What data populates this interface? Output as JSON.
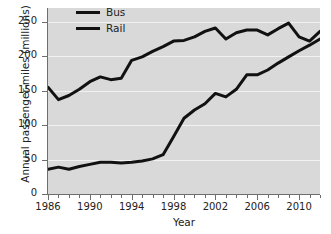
{
  "chart_data": {
    "type": "line",
    "title": "",
    "xlabel": "Year",
    "ylabel": "Annual passenger-miles (millions)",
    "xlim": [
      1986,
      2012
    ],
    "ylim": [
      0,
      270
    ],
    "grid": true,
    "legend_position": "top-left-inside",
    "y_ticks": [
      0,
      50,
      100,
      150,
      200,
      250
    ],
    "y_tick_labels": [
      "0",
      "50",
      "100",
      "150",
      "200",
      "250"
    ],
    "x_ticks": [
      1986,
      1990,
      1994,
      1998,
      2002,
      2006,
      2010
    ],
    "x_tick_labels": [
      "1986",
      "1990",
      "1994",
      "1998",
      "2002",
      "2006",
      "2010"
    ],
    "x_minor_ticks": [
      1986,
      1987,
      1988,
      1989,
      1990,
      1991,
      1992,
      1993,
      1994,
      1995,
      1996,
      1997,
      1998,
      1999,
      2000,
      2001,
      2002,
      2003,
      2004,
      2005,
      2006,
      2007,
      2008,
      2009,
      2010,
      2011,
      2012
    ],
    "x": [
      1986,
      1987,
      1988,
      1989,
      1990,
      1991,
      1992,
      1993,
      1994,
      1995,
      1996,
      1997,
      1998,
      1999,
      2000,
      2001,
      2002,
      2003,
      2004,
      2005,
      2006,
      2007,
      2008,
      2009,
      2010,
      2011,
      2012
    ],
    "series": [
      {
        "name": "Bus",
        "color": "#111111",
        "values": [
          155,
          137,
          143,
          152,
          163,
          170,
          166,
          168,
          194,
          199,
          207,
          214,
          222,
          223,
          228,
          236,
          241,
          225,
          234,
          238,
          238,
          231,
          240,
          248,
          228,
          222,
          236
        ]
      },
      {
        "name": "Rail",
        "color": "#111111",
        "values": [
          36,
          39,
          36,
          40,
          43,
          46,
          46,
          45,
          46,
          48,
          51,
          57,
          83,
          110,
          122,
          131,
          146,
          141,
          152,
          173,
          173,
          180,
          190,
          199,
          208,
          216,
          225
        ]
      }
    ]
  },
  "legend": {
    "items": [
      {
        "label": "Bus",
        "swatch": "line-swatch"
      },
      {
        "label": "Rail",
        "swatch": "line-swatch"
      }
    ]
  },
  "colors": {
    "plot_background": "#d9d9d9",
    "gridline": "#f2f2f2",
    "axis": "#6e6e6e",
    "series": "#111111",
    "text": "#222222",
    "page_background": "#ffffff"
  }
}
